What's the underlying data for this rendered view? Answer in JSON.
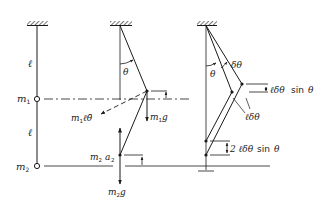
{
  "figure": {
    "colors": {
      "ink": "#1a1a1a",
      "background": "#ffffff"
    },
    "panel_left": {
      "labels": {
        "length_upper": "ℓ",
        "mass1": "m",
        "mass1_sub": "1",
        "length_lower": "ℓ",
        "mass2": "m",
        "mass2_sub": "2"
      }
    },
    "panel_middle": {
      "labels": {
        "angle": "θ",
        "inertia_force": "m",
        "inertia_force_sub": "1",
        "inertia_force_rest": "ℓθ̈",
        "weight1": "m",
        "weight1_sub": "1",
        "weight1_rest": "g",
        "inertia2": "m",
        "inertia2_sub": "2",
        "inertia2_a": "a",
        "inertia2_a_sub": "2",
        "weight2": "m",
        "weight2_sub": "2",
        "weight2_rest": "g"
      }
    },
    "panel_right": {
      "labels": {
        "angle": "θ",
        "virtual_angle": "δθ",
        "virtual_disp": "ℓδθ",
        "vertical_disp1": "ℓδθ",
        "vertical_disp1_sin": "sin",
        "vertical_disp1_theta": "θ",
        "vertical_disp2": "2 ℓδθ",
        "vertical_disp2_sin": "sin",
        "vertical_disp2_theta": "θ"
      }
    }
  }
}
